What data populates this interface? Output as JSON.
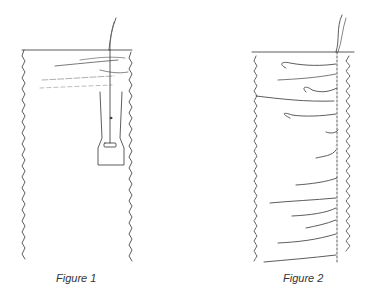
{
  "figures": [
    {
      "caption": "Figure 1",
      "description": "Fabric panel with single thread drawn through top, needle/bobbin tool hanging, short thread strands on left"
    },
    {
      "caption": "Figure 2",
      "description": "Fabric panel with thread drawn through top and many thread loops pulled across the full height"
    }
  ],
  "colors": {
    "line": "#333333",
    "light_line": "#888888",
    "background": "#ffffff"
  }
}
